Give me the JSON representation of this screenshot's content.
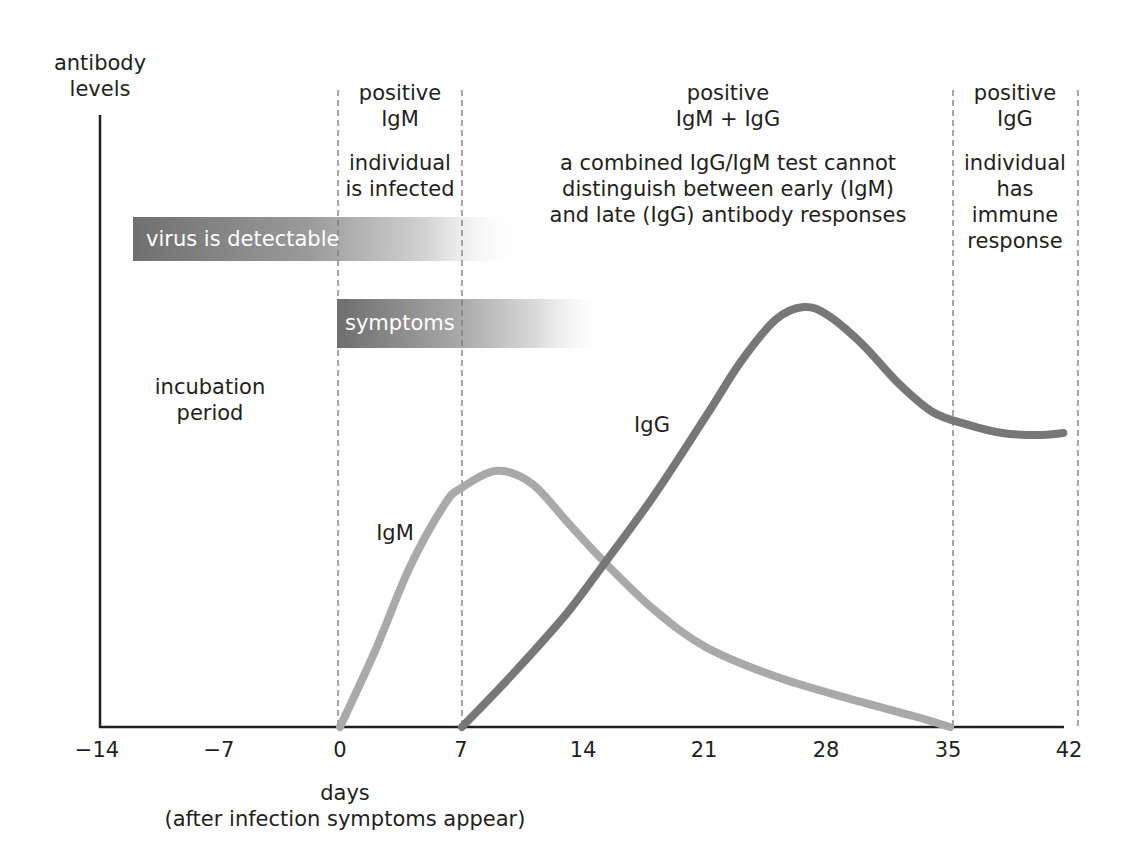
{
  "chart_data": {
    "type": "line",
    "title": "",
    "ylabel": "antibody levels",
    "xlabel": "days",
    "xlabel_sub": "(after infection symptoms appear)",
    "x_ticks": [
      -14,
      -7,
      0,
      7,
      14,
      21,
      28,
      35,
      42
    ],
    "x_tick_labels": [
      "−14",
      "−7",
      "0",
      "7",
      "14",
      "21",
      "28",
      "35",
      "42"
    ],
    "xlim": [
      -14,
      42
    ],
    "ylim": [
      0,
      100
    ],
    "y_units": "relative (arbitrary)",
    "grid": false,
    "phase_dividers_days": [
      0,
      7,
      35,
      42
    ],
    "series": [
      {
        "name": "IgM",
        "color": "#a9a9a9",
        "points": [
          [
            0,
            0
          ],
          [
            2,
            18
          ],
          [
            4,
            38
          ],
          [
            6,
            53
          ],
          [
            7,
            57
          ],
          [
            9,
            61
          ],
          [
            11,
            58
          ],
          [
            13,
            49
          ],
          [
            15,
            40
          ],
          [
            18,
            28
          ],
          [
            21,
            19
          ],
          [
            25,
            12
          ],
          [
            29,
            7
          ],
          [
            33,
            2.5
          ],
          [
            35,
            0
          ]
        ]
      },
      {
        "name": "IgG",
        "color": "#777777",
        "points": [
          [
            7,
            0
          ],
          [
            10,
            13
          ],
          [
            13,
            27
          ],
          [
            15,
            38
          ],
          [
            18,
            55
          ],
          [
            21,
            74
          ],
          [
            23,
            87
          ],
          [
            25,
            97
          ],
          [
            26.6,
            100
          ],
          [
            28,
            98
          ],
          [
            30,
            91
          ],
          [
            32,
            82
          ],
          [
            34,
            75
          ],
          [
            36,
            72
          ],
          [
            38,
            70
          ],
          [
            40,
            69.5
          ],
          [
            41.5,
            70
          ]
        ]
      }
    ],
    "bars": [
      {
        "label": "virus is detectable",
        "start_day": -12,
        "solid_end_day": 0,
        "fade_end_day": 10,
        "color": "#7f7f7f"
      },
      {
        "label": "symptoms",
        "start_day": 0,
        "solid_end_day": 7,
        "fade_end_day": 15,
        "color": "#7f7f7f"
      }
    ],
    "annotations": [
      {
        "text": "incubation period",
        "day": -7
      },
      {
        "text": "IgM",
        "day": 2.5,
        "level": 46
      },
      {
        "text": "IgG",
        "day": 17.5,
        "level": 70
      }
    ],
    "phases": [
      {
        "title": "positive IgM",
        "description": "individual is infected",
        "from_day": 0,
        "to_day": 7
      },
      {
        "title": "positive IgM + IgG",
        "description": "a combined IgG/IgM test cannot distinguish between early (IgM) and late (IgG) antibody responses",
        "from_day": 7,
        "to_day": 35
      },
      {
        "title": "positive IgG",
        "description": "individual has immune response",
        "from_day": 35,
        "to_day": 42
      }
    ]
  },
  "labels": {
    "y_axis_line1": "antibody",
    "y_axis_line2": "levels",
    "x_axis_title": "days",
    "x_axis_subtitle": "(after infection symptoms appear)",
    "ticks": [
      "−14",
      "−7",
      "0",
      "7",
      "14",
      "21",
      "28",
      "35",
      "42"
    ],
    "phase1_title1": "positive",
    "phase1_title2": "IgM",
    "phase1_desc1": "individual",
    "phase1_desc2": "is infected",
    "phase2_title1": "positive",
    "phase2_title2": "IgM + IgG",
    "phase2_desc1": "a combined IgG/IgM test cannot",
    "phase2_desc2": "distinguish between early (IgM)",
    "phase2_desc3": "and late (IgG) antibody responses",
    "phase3_title1": "positive",
    "phase3_title2": "IgG",
    "phase3_desc1": "individual",
    "phase3_desc2": "has",
    "phase3_desc3": "immune",
    "phase3_desc4": "response",
    "incubation1": "incubation",
    "incubation2": "period",
    "virus_bar": "virus is detectable",
    "symptoms_bar": "symptoms",
    "igm_label": "IgM",
    "igg_label": "IgG"
  }
}
